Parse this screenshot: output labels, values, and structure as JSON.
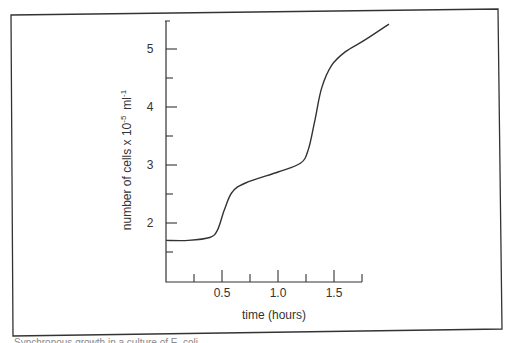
{
  "chart_data": {
    "type": "line",
    "title": "",
    "xlabel": "time  (hours)",
    "ylabel": "number of cells x 10",
    "ylabel_exp1": "-5",
    "ylabel_unit": "ml",
    "ylabel_exp2": "-1",
    "xlim": [
      0,
      2.0
    ],
    "ylim": [
      1.0,
      5.5
    ],
    "x_ticks": [
      0.25,
      0.5,
      0.75,
      1.0,
      1.25,
      1.5,
      1.75
    ],
    "x_tick_labels": [
      {
        "value": 0.5,
        "label": "0.5"
      },
      {
        "value": 1.0,
        "label": "1.0"
      },
      {
        "value": 1.5,
        "label": "1.5"
      }
    ],
    "y_ticks": [
      1.5,
      2,
      2.5,
      3,
      3.5,
      4,
      4.5,
      5
    ],
    "y_tick_labels": [
      {
        "value": 2,
        "label": "2"
      },
      {
        "value": 3,
        "label": "3"
      },
      {
        "value": 4,
        "label": "4"
      },
      {
        "value": 5,
        "label": "5"
      }
    ],
    "grid": false,
    "legend": null,
    "series": [
      {
        "name": "cell count",
        "x": [
          0,
          0.2,
          0.39,
          0.46,
          0.52,
          0.59,
          0.71,
          1.0,
          1.2,
          1.27,
          1.33,
          1.39,
          1.48,
          1.6,
          1.78,
          1.99
        ],
        "y": [
          1.7,
          1.7,
          1.75,
          1.88,
          2.22,
          2.53,
          2.69,
          2.88,
          3.03,
          3.26,
          3.78,
          4.33,
          4.72,
          4.95,
          5.16,
          5.43
        ]
      }
    ]
  },
  "caption": "Synchronous growth in a culture of E. coli"
}
